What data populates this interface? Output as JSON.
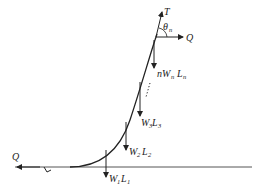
{
  "diagram": {
    "type": "free-body force diagram of a cable/mooring line",
    "labels": {
      "tension": "T",
      "angle": "θ",
      "angle_sub": "n",
      "q_top": "Q",
      "q_bottom": "Q",
      "wn_prefix": "nW",
      "wn_sub1": "n",
      "wn_L": "L",
      "wn_sub2": "n",
      "w3": "W",
      "w3_sub1": "3",
      "w3_L": "L",
      "w3_sub2": "3",
      "w2": "W",
      "w2_sub1": "2",
      "w2_L": "L",
      "w2_sub2": "2",
      "w1": "W",
      "w1_sub1": "1",
      "w1_L": "L",
      "w1_sub2": "1"
    },
    "colors": {
      "line": "#222222",
      "ground": "#555555"
    }
  }
}
